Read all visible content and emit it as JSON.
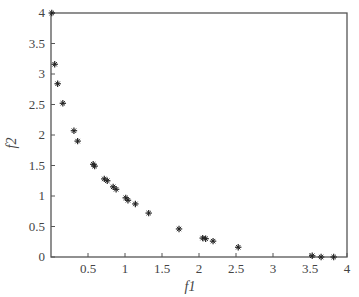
{
  "chart_data": {
    "type": "scatter",
    "title": "",
    "xlabel": "f1",
    "ylabel": "f2",
    "xlim": [
      0,
      4
    ],
    "ylim": [
      0,
      4
    ],
    "xticks": [
      0.5,
      1,
      1.5,
      2,
      2.5,
      3,
      3.5,
      4
    ],
    "xtick_labels": [
      "0.5",
      "1",
      "1.5",
      "2",
      "2.5",
      "3",
      "3.5",
      "4"
    ],
    "yticks": [
      0,
      0.5,
      1,
      1.5,
      2,
      2.5,
      3,
      3.5,
      4
    ],
    "ytick_labels": [
      "0",
      "0.5",
      "1",
      "1.5",
      "2",
      "2.5",
      "3",
      "3.5",
      "4"
    ],
    "grid": false,
    "legend": null,
    "marker": "star",
    "color": "#222222",
    "series": [
      {
        "name": "Pareto front",
        "x": [
          0.01,
          0.05,
          0.09,
          0.16,
          0.31,
          0.36,
          0.57,
          0.59,
          0.72,
          0.76,
          0.84,
          0.88,
          1.01,
          1.04,
          1.14,
          1.32,
          1.73,
          2.05,
          2.09,
          2.19,
          2.53,
          3.53,
          3.65,
          3.82
        ],
        "y": [
          4.0,
          3.16,
          2.84,
          2.52,
          2.07,
          1.9,
          1.52,
          1.49,
          1.28,
          1.25,
          1.15,
          1.11,
          0.97,
          0.93,
          0.87,
          0.72,
          0.46,
          0.31,
          0.3,
          0.26,
          0.16,
          0.02,
          0.0,
          0.0
        ]
      }
    ]
  },
  "labels": {
    "xlabel": "f1",
    "ylabel": "f2"
  }
}
